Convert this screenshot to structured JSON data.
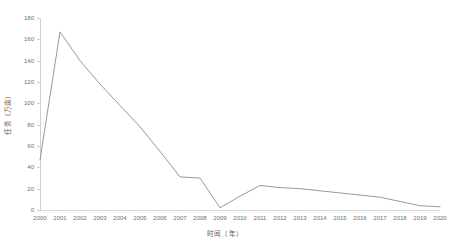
{
  "chart_data": {
    "type": "line",
    "title": "",
    "xlabel": "时间（年）",
    "ylabel": "任务（万亩）",
    "grid": false,
    "legend": "none",
    "line_color": "#8c8c8c",
    "axis_color": "#d0d0d0",
    "tick_label_color": "#6f6f6f",
    "xlim": [
      2000,
      2020
    ],
    "ylim": [
      0,
      180
    ],
    "ytick_step": 20,
    "yticks": [
      0,
      20,
      40,
      60,
      80,
      100,
      120,
      140,
      160,
      180
    ],
    "categories": [
      "2000",
      "2001",
      "2002",
      "2003",
      "2004",
      "2005",
      "2006",
      "2007",
      "2008",
      "2009",
      "2010",
      "2011",
      "2012",
      "2013",
      "2014",
      "2015",
      "2016",
      "2017",
      "2018",
      "2019",
      "2020"
    ],
    "values": [
      47,
      167,
      140,
      118,
      98,
      78,
      55,
      31,
      30,
      2,
      13,
      23,
      21,
      20,
      18,
      16,
      14,
      12,
      8,
      4,
      3
    ]
  }
}
